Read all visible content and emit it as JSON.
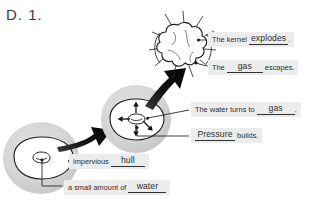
{
  "worksheet": {
    "question_number": "D. 1.",
    "top_cut_text": "",
    "colors": {
      "label_background": "#ececed",
      "circle_fill": "#d5d5d5",
      "ink": "#2e2e2e",
      "arrow": "#141414",
      "page": "#ffffff"
    }
  },
  "diagram": {
    "stages": [
      {
        "id": "stage-1-unpopped-kernel",
        "name": "unpopped kernel with water inside",
        "cx": 40,
        "cy": 158,
        "r": 36
      },
      {
        "id": "stage-2-heated-kernel",
        "name": "heated kernel with pressure arrows",
        "cx": 135,
        "cy": 119,
        "r": 34
      },
      {
        "id": "stage-3-popped-kernel",
        "name": "popped popcorn bursting",
        "cx": 184,
        "cy": 48,
        "r": 30
      }
    ],
    "flow_arrows": [
      {
        "id": "arrow-stage1-to-stage2",
        "name": "curved arrow from kernel to heating kernel"
      },
      {
        "id": "arrow-stage2-to-stage3",
        "name": "curved arrow from heating kernel to popped kernel"
      }
    ],
    "pressure_arrows": [
      {
        "id": "pressure-arrow-up",
        "direction": "up"
      },
      {
        "id": "pressure-arrow-down",
        "direction": "down"
      },
      {
        "id": "pressure-arrow-left",
        "direction": "left"
      },
      {
        "id": "pressure-arrow-down-right",
        "direction": "down-right"
      }
    ]
  },
  "labels": [
    {
      "id": "kernel-explodes",
      "prefix": "The kernel ",
      "answer": "explodes",
      "suffix": "."
    },
    {
      "id": "gas-escapes",
      "prefix": "The ",
      "answer": "gas",
      "suffix": " escapes."
    },
    {
      "id": "water-turns-to-gas",
      "prefix": "The water turns to ",
      "answer": "gas",
      "suffix": "."
    },
    {
      "id": "pressure-builds",
      "prefix": "",
      "answer": "Pressure",
      "suffix": " builds."
    },
    {
      "id": "impervious-hull",
      "prefix": "impervious ",
      "answer": "hull",
      "suffix": ""
    },
    {
      "id": "small-amount-of-water",
      "prefix": "a small amount of ",
      "answer": "water",
      "suffix": ""
    }
  ]
}
